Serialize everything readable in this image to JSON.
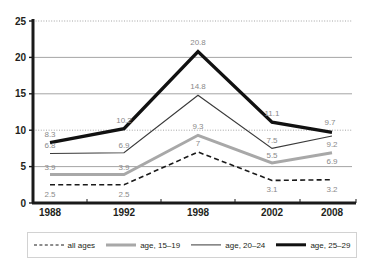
{
  "chart_data": {
    "type": "line",
    "title": "",
    "xlabel": "",
    "ylabel": "",
    "categories": [
      "1988",
      "1992",
      "1998",
      "2002",
      "2008"
    ],
    "ylim": [
      0,
      25
    ],
    "yticks": [
      0,
      5,
      10,
      15,
      20,
      25
    ],
    "grid": {
      "x": false,
      "y": true,
      "dotted_at": [
        10,
        25
      ],
      "solid_at": [
        5,
        15,
        20
      ]
    },
    "legend_position": "bottom",
    "series": [
      {
        "name": "all ages",
        "style": "dashed",
        "color": "#1a1a1a",
        "width": 1.6,
        "values": [
          2.5,
          2.5,
          7,
          3.1,
          3.2
        ],
        "labels": [
          "2.5",
          "2.5",
          "7",
          "3.1",
          "3.2"
        ]
      },
      {
        "name": "age, 15–19",
        "style": "solid",
        "color": "#a8a8a8",
        "width": 3,
        "values": [
          3.9,
          3.9,
          9.3,
          5.5,
          6.9
        ],
        "labels": [
          "3.9",
          "3.9",
          "9.3",
          "5.5",
          "6.9"
        ]
      },
      {
        "name": "age, 20–24",
        "style": "solid",
        "color": "#3a3a3a",
        "width": 1.2,
        "values": [
          6.8,
          6.9,
          14.8,
          7.5,
          9.2
        ],
        "labels": [
          "6.8",
          "6.9",
          "14.8",
          "7.5",
          "9.2"
        ]
      },
      {
        "name": "age, 25–29",
        "style": "solid",
        "color": "#111111",
        "width": 3.4,
        "values": [
          8.3,
          10.2,
          20.8,
          11.1,
          9.7
        ],
        "labels": [
          "8.3",
          "10.2",
          "20.8",
          "11.1",
          "9.7"
        ]
      }
    ]
  },
  "axis": {
    "y_tick_labels": [
      "25",
      "20",
      "15",
      "10",
      "5",
      "0"
    ],
    "x_tick_labels": [
      "1988",
      "1992",
      "1998",
      "2002",
      "2008"
    ]
  },
  "legend": {
    "items": [
      {
        "label": "all ages",
        "swatch": "sw-dashed",
        "icon": "dashed-line-icon"
      },
      {
        "label": "age, 15–19",
        "swatch": "sw-thick-grey",
        "icon": "thick-grey-line-icon"
      },
      {
        "label": "age, 20–24",
        "swatch": "sw-thin-black",
        "icon": "thin-black-line-icon"
      },
      {
        "label": "age, 25–29",
        "swatch": "sw-thick-black",
        "icon": "thick-black-line-icon"
      }
    ]
  },
  "colors": {
    "axis": "#1a1a1a",
    "grid_solid": "#9b9b9b",
    "grid_dotted": "#9b9b9b",
    "label_text": "#8a8a8a",
    "tick_text": "#231f20",
    "legend_border": "#d2d2d2",
    "background": "#ffffff"
  }
}
